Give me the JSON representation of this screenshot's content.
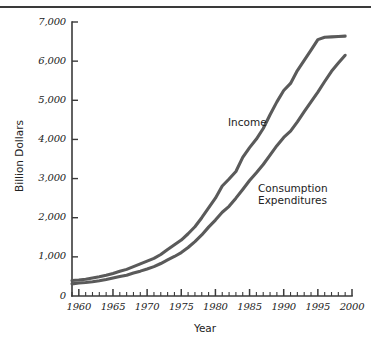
{
  "figure": {
    "has_top_rule": true,
    "background_color": "#ffffff",
    "line_color": "#5a5a5a",
    "axis_color": "#3a3a3a",
    "text_color": "#222222"
  },
  "chart_data": {
    "type": "line",
    "title": "",
    "xlabel": "Year",
    "ylabel": "Billion Dollars",
    "xlim": [
      1959,
      2000
    ],
    "ylim": [
      0,
      7000
    ],
    "grid": false,
    "legend_position": "inline-annotation",
    "x_ticks_major": [
      1960,
      1965,
      1970,
      1975,
      1980,
      1985,
      1990,
      1995,
      2000
    ],
    "x_tick_labels": [
      "1960",
      "1965",
      "1970",
      "1975",
      "1980",
      "1985",
      "1990",
      "1995",
      "2000"
    ],
    "x_minor_tick_interval": 1,
    "y_ticks": [
      0,
      1000,
      2000,
      3000,
      4000,
      5000,
      6000,
      7000
    ],
    "y_tick_labels": [
      "0",
      "1,000",
      "2,000",
      "3,000",
      "4,000",
      "5,000",
      "6,000",
      "7,000"
    ],
    "x": [
      1959,
      1960,
      1961,
      1962,
      1963,
      1964,
      1965,
      1966,
      1967,
      1968,
      1969,
      1970,
      1971,
      1972,
      1973,
      1974,
      1975,
      1976,
      1977,
      1978,
      1979,
      1980,
      1981,
      1982,
      1983,
      1984,
      1985,
      1986,
      1987,
      1988,
      1989,
      1990,
      1991,
      1992,
      1993,
      1994,
      1995,
      1996,
      1997,
      1998,
      1999
    ],
    "series": [
      {
        "name": "Income",
        "label": "Income",
        "color": "#5a5a5a",
        "values": [
          395,
          410,
          430,
          460,
          490,
          530,
          575,
          630,
          680,
          750,
          820,
          890,
          960,
          1060,
          1190,
          1310,
          1430,
          1590,
          1770,
          2000,
          2250,
          2500,
          2810,
          2990,
          3180,
          3540,
          3790,
          4010,
          4280,
          4630,
          4960,
          5250,
          5430,
          5760,
          6020,
          6280,
          6550,
          6610,
          6620,
          6630,
          6640
        ]
      },
      {
        "name": "Consumption Expenditures",
        "label": "Consumption\nExpenditures",
        "label_line1": "Consumption",
        "label_line2": "Expenditures",
        "color": "#5a5a5a",
        "values": [
          310,
          330,
          345,
          365,
          390,
          420,
          460,
          500,
          530,
          585,
          635,
          690,
          750,
          830,
          920,
          1010,
          1110,
          1240,
          1390,
          1560,
          1760,
          1940,
          2140,
          2290,
          2500,
          2720,
          2950,
          3150,
          3360,
          3600,
          3840,
          4050,
          4210,
          4450,
          4710,
          4960,
          5210,
          5480,
          5740,
          5950,
          6150
        ]
      }
    ],
    "annotations": [
      {
        "text": "Income",
        "x": 1988,
        "y": 4600
      },
      {
        "text": "Consumption Expenditures",
        "x": 1992,
        "y": 2850
      }
    ]
  },
  "axis_titles": {
    "y": "Billion Dollars",
    "x": "Year"
  },
  "series_labels": {
    "income": "Income",
    "consumption_line1": "Consumption",
    "consumption_line2": "Expenditures"
  }
}
